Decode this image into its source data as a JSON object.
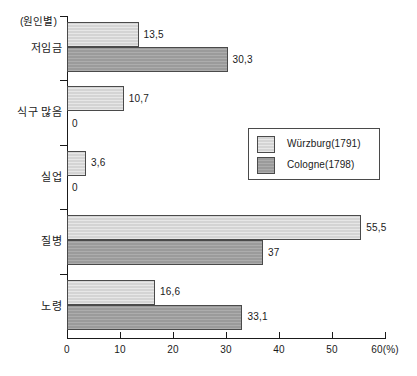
{
  "chart_data": {
    "type": "bar",
    "orientation": "horizontal",
    "title": "",
    "axis_title": "(원인별)",
    "xlabel": "60(%)",
    "ylabel": "",
    "xlim": [
      0,
      60
    ],
    "grid": false,
    "legend_position": "center-right",
    "categories": [
      "저임금",
      "식구 많음",
      "실업",
      "질병",
      "노령"
    ],
    "series": [
      {
        "name": "Würzburg(1791)",
        "color": "#d4d4d4",
        "values": [
          13.5,
          10.7,
          3.6,
          55.5,
          16.6
        ],
        "labels": [
          "13,5",
          "10,7",
          "3,6",
          "55,5",
          "16,6"
        ]
      },
      {
        "name": "Cologne(1798)",
        "color": "#9b9b9b",
        "values": [
          30.3,
          0,
          0,
          37,
          33.1
        ],
        "labels": [
          "30,3",
          "0",
          "0",
          "37",
          "33,1"
        ]
      }
    ],
    "x_ticks": [
      0,
      10,
      20,
      30,
      40,
      50,
      60
    ],
    "x_tick_labels": [
      "0",
      "10",
      "20",
      "30",
      "40",
      "50",
      "60(%)"
    ]
  },
  "legend": {
    "items": [
      {
        "label": "Würzburg(1791)",
        "color": "#d4d4d4"
      },
      {
        "label": "Cologne(1798)",
        "color": "#9b9b9b"
      }
    ]
  }
}
